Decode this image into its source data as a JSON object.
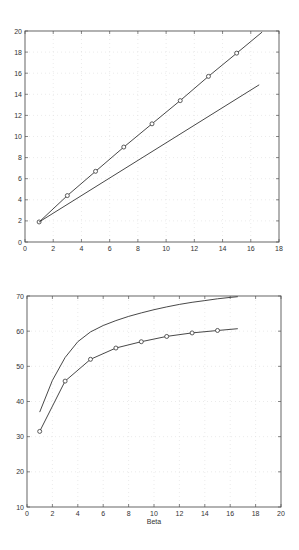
{
  "chart_data": [
    {
      "type": "line",
      "title": "",
      "xlabel": "",
      "ylabel": "",
      "xlim": [
        0,
        18
      ],
      "ylim": [
        0,
        20
      ],
      "xticks": [
        0,
        2,
        4,
        6,
        8,
        10,
        12,
        14,
        16,
        18
      ],
      "yticks": [
        0,
        2,
        4,
        6,
        8,
        10,
        12,
        14,
        16,
        18,
        20
      ],
      "grid": true,
      "legend": null,
      "series": [
        {
          "name": "line with circle markers",
          "marker": "o",
          "x": [
            1,
            3,
            5,
            7,
            9,
            11,
            13,
            15,
            16.8
          ],
          "y": [
            1.9,
            4.4,
            6.7,
            9.0,
            11.2,
            13.4,
            15.7,
            17.9,
            19.9
          ],
          "marker_x": [
            1,
            3,
            5,
            7,
            9,
            11,
            13,
            15
          ]
        },
        {
          "name": "plain line",
          "marker": "none",
          "x": [
            1,
            16.6
          ],
          "y": [
            1.9,
            14.9
          ],
          "marker_x": []
        }
      ]
    },
    {
      "type": "line",
      "title": "",
      "xlabel": "Beta",
      "ylabel": "",
      "xlim": [
        0,
        20
      ],
      "ylim": [
        10,
        70
      ],
      "xticks": [
        0,
        2,
        4,
        6,
        8,
        10,
        12,
        14,
        16,
        18,
        20
      ],
      "yticks": [
        10,
        20,
        30,
        40,
        50,
        60,
        70
      ],
      "grid": true,
      "legend": null,
      "series": [
        {
          "name": "upper curve",
          "marker": "none",
          "x": [
            1,
            2,
            3,
            4,
            5,
            6,
            7,
            8,
            9,
            10,
            11,
            12,
            13,
            14,
            15,
            16,
            16.6
          ],
          "y": [
            37.0,
            46.0,
            52.5,
            57.0,
            59.8,
            61.6,
            63.0,
            64.2,
            65.2,
            66.1,
            66.9,
            67.6,
            68.2,
            68.7,
            69.2,
            69.6,
            69.8
          ],
          "marker_x": []
        },
        {
          "name": "lower curve with circle markers",
          "marker": "o",
          "x": [
            1,
            3,
            5,
            7,
            9,
            11,
            13,
            15,
            16.6
          ],
          "y": [
            31.5,
            45.8,
            52.0,
            55.2,
            57.0,
            58.5,
            59.5,
            60.2,
            60.7
          ],
          "marker_x": [
            1,
            3,
            5,
            7,
            9,
            11,
            13,
            15
          ]
        }
      ]
    }
  ],
  "colors": {
    "axis": "#555555",
    "line": "#333333",
    "grid": "#dddddd"
  }
}
